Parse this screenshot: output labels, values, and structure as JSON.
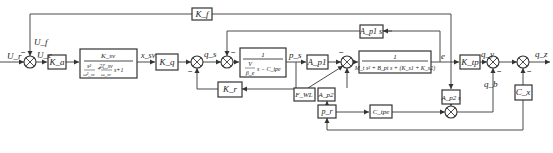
{
  "diagram": {
    "type": "control-block-diagram",
    "signals": {
      "input_voltage": "U_r",
      "feedback_voltage": "U_f",
      "error_voltage": "U_e",
      "spool_displacement": "x_sv",
      "flow_q": "q_s",
      "pressure": "p_s",
      "error_e": "e",
      "flow_out_qy": "q_y",
      "flow_leak_qb": "q_b",
      "output": "q_z"
    },
    "blocks": {
      "amplifier": "K_a",
      "servo_valve": {
        "numerator": "K_sv",
        "denominator_term1_num": "s²",
        "denominator_term1_den": "ω²_sv",
        "denominator_term2": "2ζ_sv",
        "denominator_term2_den": "ω_sv",
        "denominator_tail": "s+1"
      },
      "flow_gain": "K_q",
      "pressure_feedback": "K_r",
      "chamber": {
        "numerator": "1",
        "denominator_top": "V",
        "denominator_bottom": "β_e",
        "denominator_tail": "s − C_tpe"
      },
      "area_a": "A_p1",
      "area_a_s": "A_p1 s",
      "mass": {
        "numerator": "1",
        "denominator": "M_t s² + B_pt s + (K_s1 + K_s2)"
      },
      "load_force": "F_WL",
      "area_b": "A_p2",
      "pressure_r": "p_r",
      "leak": "C_tpe",
      "area_b_s": "A_p2 s",
      "gain_tp": "K_tp",
      "comp": "C_x",
      "feedback_gain": "K_f"
    },
    "signs": {
      "minus": "−"
    }
  }
}
